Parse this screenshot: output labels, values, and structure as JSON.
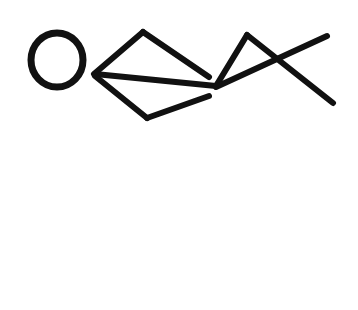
{
  "canvas": {
    "width": 358,
    "height": 310,
    "background_color": "#ffffff",
    "title": "Abstract line drawing",
    "description": "Black freehand-style line drawing resembling a stylized fish: an open circle at the left, an angular body of straight strokes, and a crossed tail at the right."
  },
  "style": {
    "stroke_color": "#111111",
    "stroke_width": 6,
    "stroke_linecap": "round",
    "stroke_linejoin": "round",
    "fill": "none"
  },
  "shapes": [
    {
      "id": "eye-circle",
      "name": "circle",
      "kind": "ellipse",
      "cx": 57,
      "cy": 60,
      "rx": 26,
      "ry": 27,
      "stroke_width": 7
    },
    {
      "id": "body-upper-left-stroke",
      "name": "upper-left-stroke",
      "kind": "polyline",
      "points": "94,74 143,32"
    },
    {
      "id": "body-upper-right-stroke",
      "name": "upper-right-stroke",
      "kind": "polyline",
      "points": "143,32 209,77"
    },
    {
      "id": "body-middle-stroke",
      "name": "middle-horizontal-stroke",
      "kind": "polyline",
      "points": "95,74 216,86"
    },
    {
      "id": "body-lower-left-stroke",
      "name": "lower-left-stroke",
      "kind": "polyline",
      "points": "95,76 147,118"
    },
    {
      "id": "body-lower-right-stroke",
      "name": "lower-right-stroke",
      "kind": "polyline",
      "points": "147,118 209,96"
    },
    {
      "id": "tail-upper-stroke",
      "name": "tail-upper-stroke",
      "kind": "polyline",
      "points": "216,86 247,35"
    },
    {
      "id": "tail-lower-stroke",
      "name": "tail-lower-stroke",
      "kind": "polyline",
      "points": "247,35 333,103"
    },
    {
      "id": "tail-cross-stroke",
      "name": "tail-cross-stroke",
      "kind": "polyline",
      "points": "216,87 327,36"
    }
  ]
}
